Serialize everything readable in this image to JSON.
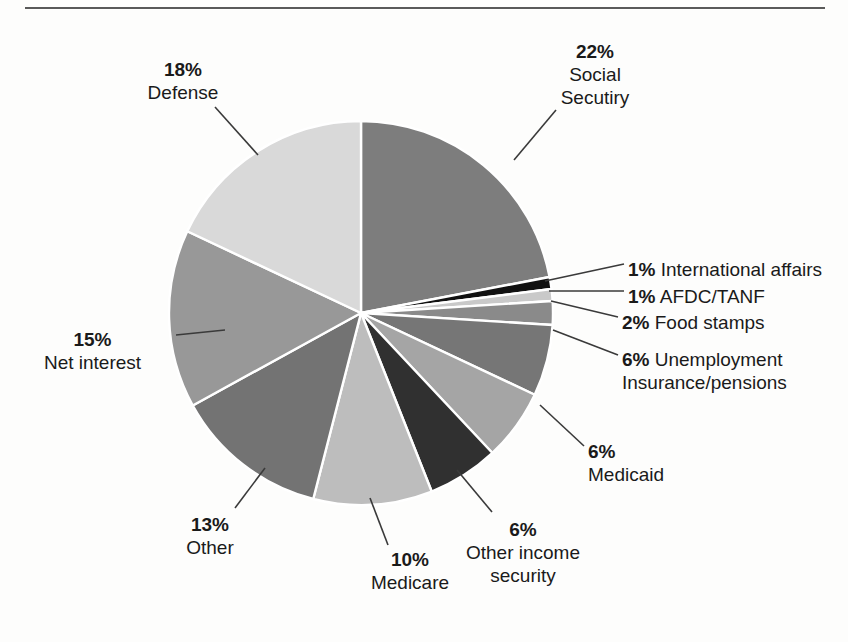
{
  "figure": {
    "background_color": "#fdfdfc",
    "rule_color": "#5a5a5a",
    "separator_color": "#ffffff"
  },
  "chart_data": {
    "type": "pie",
    "title": "",
    "xlabel": "",
    "ylabel": "",
    "units": "percent",
    "start_angle_deg": 0,
    "direction": "clockwise",
    "center": [
      361,
      313
    ],
    "radius": 192,
    "labels": [
      "Social Secutiry",
      "International affairs",
      "AFDC/TANF",
      "Food stamps",
      "Unemployment Insurance/pensions",
      "Medicaid",
      "Other income security",
      "Medicare",
      "Other",
      "Net interest",
      "Defense"
    ],
    "values": [
      22,
      1,
      1,
      2,
      6,
      6,
      6,
      10,
      13,
      15,
      18
    ],
    "colors": [
      "#7d7d7d",
      "#111111",
      "#c9c9c9",
      "#8a8a8a",
      "#767676",
      "#a5a5a5",
      "#303030",
      "#bdbdbd",
      "#737373",
      "#989898",
      "#d9d9d9"
    ],
    "legend": "none",
    "grid": false
  },
  "labels": {
    "social": {
      "pct": "22%",
      "line1": "Social",
      "line2": "Secutiry"
    },
    "defense": {
      "pct": "18%",
      "line1": "Defense"
    },
    "international": {
      "pct": "1%",
      "line1": "International affairs"
    },
    "afdc": {
      "pct": "1%",
      "line1": "AFDC/TANF"
    },
    "food_stamps": {
      "pct": "2%",
      "line1": "Food stamps"
    },
    "unemployment": {
      "pct": "6%",
      "line1": "Unemployment",
      "line2": "Insurance/pensions"
    },
    "medicaid": {
      "pct": "6%",
      "line1": "Medicaid"
    },
    "other_income_security": {
      "pct": "6%",
      "line1": "Other income",
      "line2": "security"
    },
    "medicare": {
      "pct": "10%",
      "line1": "Medicare"
    },
    "other": {
      "pct": "13%",
      "line1": "Other"
    },
    "net_interest": {
      "pct": "15%",
      "line1": "Net interest"
    }
  }
}
